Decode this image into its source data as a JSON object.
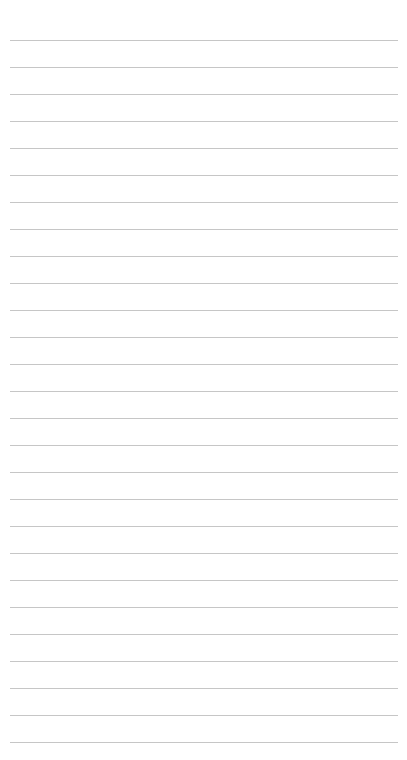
{
  "page": {
    "type": "ruled-notepad",
    "background": "#ffffff",
    "line_color": "#c6c6c6",
    "line_count": 27,
    "first_line_y": 40,
    "line_spacing": 27,
    "line_left": 10,
    "line_right": 398
  }
}
